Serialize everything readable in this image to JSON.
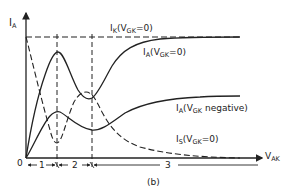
{
  "diagram": {
    "caption": "(b)",
    "y_axis": {
      "symbol": "I",
      "sub": "A"
    },
    "x_axis": {
      "symbol": "V",
      "sub": "AK"
    },
    "origin": "0",
    "regions": [
      "1",
      "2",
      "3"
    ],
    "curves": [
      {
        "id": "ik",
        "symbol": "I",
        "sub": "K",
        "cond_v": "V",
        "cond_sub": "GK",
        "cond_rest": "=0)",
        "style": "dashed"
      },
      {
        "id": "ia0",
        "symbol": "I",
        "sub": "A",
        "cond_v": "V",
        "cond_sub": "GK",
        "cond_rest": "=0)",
        "style": "solid"
      },
      {
        "id": "ianeg",
        "symbol": "I",
        "sub": "A",
        "cond_v": "V",
        "cond_sub": "GK",
        "cond_rest": " negative)",
        "style": "solid"
      },
      {
        "id": "is",
        "symbol": "I",
        "sub": "S",
        "cond_v": "V",
        "cond_sub": "GK",
        "cond_rest": "=0)",
        "style": "dashed"
      }
    ],
    "color": "#222222"
  }
}
